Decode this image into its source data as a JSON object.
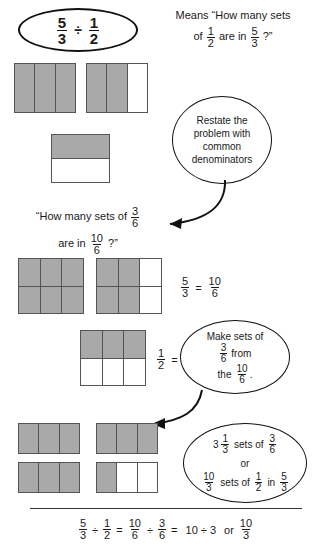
{
  "problem": {
    "dividend": {
      "num": "5",
      "den": "3"
    },
    "operator": "÷",
    "divisor": {
      "num": "1",
      "den": "2"
    }
  },
  "means_text": {
    "line1": "Means “How many sets",
    "line2_pre": "of",
    "line2_frac": {
      "num": "1",
      "den": "2"
    },
    "line2_mid": "are in",
    "line2_frac2": {
      "num": "5",
      "den": "3"
    },
    "line2_end": "?”"
  },
  "callouts": {
    "restate": {
      "line1": "Restate the",
      "line2": "problem with",
      "line3": "common",
      "line4": "denominators"
    },
    "make_sets": {
      "line1": "Make sets of",
      "frac_from": {
        "num": "3",
        "den": "6"
      },
      "word_from": "from",
      "word_the": "the",
      "frac_the": {
        "num": "10",
        "den": "6"
      },
      "period": "."
    },
    "answer": {
      "line1_whole": "3",
      "line1_frac": {
        "num": "1",
        "den": "3"
      },
      "line1_mid": "sets of",
      "line1_frac2": {
        "num": "3",
        "den": "6"
      },
      "line2": "or",
      "line3_frac": {
        "num": "10",
        "den": "3"
      },
      "line3_mid": "sets of",
      "line3_frac2": {
        "num": "1",
        "den": "2"
      },
      "line3_in": "in",
      "line3_frac3": {
        "num": "5",
        "den": "3"
      }
    }
  },
  "restate_question": {
    "line1_pre": "“How many sets of",
    "line1_frac": {
      "num": "3",
      "den": "6"
    },
    "line2_pre": "are in",
    "line2_frac": {
      "num": "10",
      "den": "6"
    },
    "line2_end": "?”"
  },
  "equations": {
    "five_thirds": {
      "left": {
        "num": "5",
        "den": "3"
      },
      "sign": "=",
      "right": {
        "num": "10",
        "den": "6"
      }
    },
    "one_half": {
      "left": {
        "num": "1",
        "den": "2"
      },
      "sign": "=",
      "right": {
        "num": "3",
        "den": "6"
      }
    }
  },
  "summary": {
    "f1": {
      "num": "5",
      "den": "3"
    },
    "op1": "÷",
    "f2": {
      "num": "1",
      "den": "2"
    },
    "eq1": "=",
    "f3": {
      "num": "10",
      "den": "6"
    },
    "op2": "÷",
    "f4": {
      "num": "3",
      "den": "6"
    },
    "eq2": "=",
    "expr": "10 ÷ 3",
    "word_or": "or",
    "f5": {
      "num": "10",
      "den": "3"
    }
  },
  "models": {
    "row1_bar_a": {
      "cells": 3,
      "shaded": 3
    },
    "row1_bar_b": {
      "cells": 3,
      "shaded": 2
    },
    "row1_half": {
      "rows": 2,
      "cols": 1,
      "shaded_rows": 1
    },
    "row2_grid_a": {
      "rows": 2,
      "cols": 3,
      "shaded": 6
    },
    "row2_grid_b": {
      "rows": 2,
      "cols": 3,
      "shaded": 4
    },
    "row3_grid": {
      "rows": 2,
      "cols": 3,
      "shaded": 3
    },
    "row4_bar_a": {
      "cells": 3,
      "shaded": 3
    },
    "row4_bar_b": {
      "cells": 3,
      "shaded": 3
    },
    "row4_bar_c": {
      "cells": 3,
      "shaded": 3
    },
    "row4_bar_d": {
      "cells": 3,
      "shaded": 1
    }
  },
  "colors": {
    "shade": "#a9a9a9",
    "outline": "#555555",
    "ink": "#1a1a1a"
  }
}
